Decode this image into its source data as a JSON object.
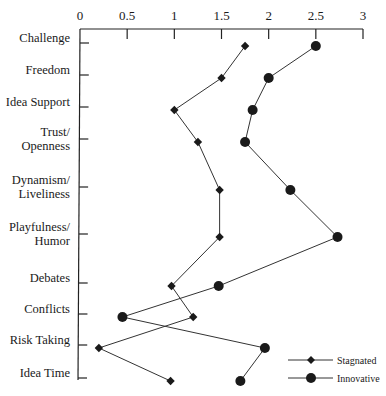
{
  "chart_data": {
    "type": "line",
    "title": "",
    "xlabel": "",
    "ylabel": "",
    "orientation": "horizontal-values-vertical-categories",
    "xlim": [
      0,
      3
    ],
    "x_ticks": [
      "0",
      "0.5",
      "1",
      "1.5",
      "2",
      "2.5",
      "3"
    ],
    "x_tick_values": [
      0,
      0.5,
      1,
      1.5,
      2,
      2.5,
      3
    ],
    "x_axis_position": "top",
    "grid": false,
    "categories": [
      [
        "Challenge"
      ],
      [
        "Freedom"
      ],
      [
        "Idea Support"
      ],
      [
        "Trust/",
        "Openness"
      ],
      [
        "Dynamism/",
        "Liveliness"
      ],
      [
        "Playfulness/",
        "Humor"
      ],
      [
        "Debates"
      ],
      [
        "Conflicts"
      ],
      [
        "Risk Taking"
      ],
      [
        "Idea Time"
      ]
    ],
    "series": [
      {
        "name": "Stagnated",
        "marker": "diamond",
        "values": [
          1.75,
          1.5,
          1.0,
          1.25,
          1.48,
          1.48,
          0.97,
          1.2,
          0.2,
          0.96
        ]
      },
      {
        "name": "Innovative",
        "marker": "circle",
        "values": [
          2.5,
          2.0,
          1.83,
          1.75,
          2.23,
          2.73,
          1.47,
          0.45,
          1.96,
          1.7
        ]
      }
    ],
    "legend": {
      "position": "bottom-right",
      "entries": [
        "Stagnated",
        "Innovative"
      ]
    }
  },
  "colors": {
    "line": "#333333",
    "marker": "#1a1a1a",
    "axis": "#222222",
    "background": "#ffffff"
  }
}
